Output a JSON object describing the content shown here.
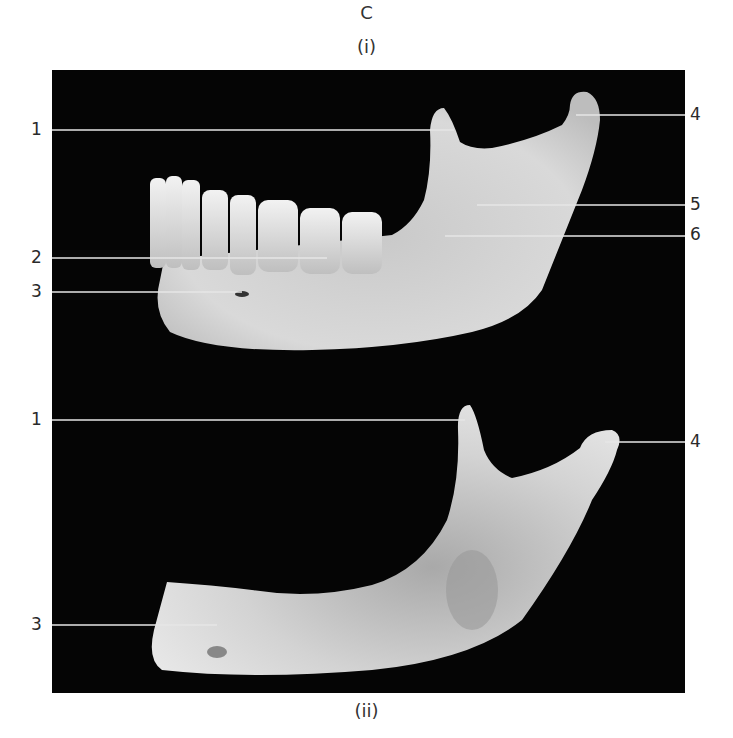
{
  "figure": {
    "panel_letter": "C",
    "top_caption": "(i)",
    "bottom_caption": "(ii)",
    "background_color": "#050505",
    "bone_color": "#d8d8d8",
    "leader_line_color": "#e6e6e6"
  },
  "views": [
    {
      "id": "i",
      "subject": "mandible with teeth (lateral radiograph)",
      "labels": [
        {
          "num": "1",
          "side": "left",
          "y": 130
        },
        {
          "num": "2",
          "side": "left",
          "y": 258
        },
        {
          "num": "3",
          "side": "left",
          "y": 292
        },
        {
          "num": "4",
          "side": "right",
          "y": 115
        },
        {
          "num": "5",
          "side": "right",
          "y": 205
        },
        {
          "num": "6",
          "side": "right",
          "y": 235
        }
      ]
    },
    {
      "id": "ii",
      "subject": "edentulous mandible (lateral radiograph)",
      "labels": [
        {
          "num": "1",
          "side": "left",
          "y": 420
        },
        {
          "num": "3",
          "side": "left",
          "y": 625
        },
        {
          "num": "4",
          "side": "right",
          "y": 442
        }
      ]
    }
  ]
}
